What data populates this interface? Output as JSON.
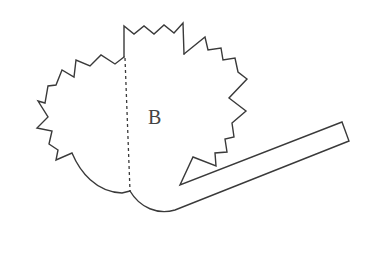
{
  "diagram": {
    "type": "line-drawing",
    "labels": [
      {
        "id": "region-b",
        "text": "B",
        "x": 148,
        "y": 124
      }
    ],
    "colors": {
      "stroke": "#3a3a3a",
      "label": "#444444",
      "background": "#ffffff"
    },
    "elements": {
      "fold_line": {
        "style": "dashed",
        "x1": 125,
        "y1": 58,
        "x2": 130,
        "y2": 192
      }
    }
  }
}
